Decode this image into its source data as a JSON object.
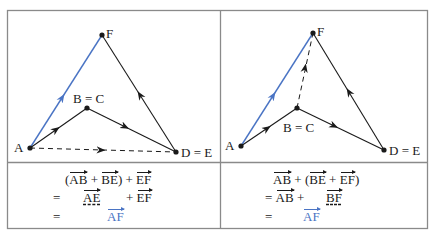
{
  "colors": {
    "border": "#8a8a8a",
    "line": "#1a1a1a",
    "accent_blue": "#4a74c4"
  },
  "left_panel": {
    "points": {
      "F": {
        "label": "F",
        "x": 102,
        "y": 35
      },
      "BC": {
        "label": "B = C",
        "x": 87,
        "y": 108
      },
      "A": {
        "label": "A",
        "x": 30,
        "y": 148
      },
      "DE": {
        "label": "D = E",
        "x": 176,
        "y": 152
      }
    },
    "equations": {
      "line1": {
        "open": "(",
        "v1": "AB",
        "plus1": " + ",
        "v2": "BE",
        "close": ")",
        "plus2": " + ",
        "v3": "EF"
      },
      "line2": {
        "eq": "=",
        "v1": "AE",
        "plus": "+ ",
        "v2": "EF"
      },
      "line3": {
        "eq": "=",
        "v1": "AF"
      }
    }
  },
  "right_panel": {
    "points": {
      "F": {
        "label": "F",
        "x": 313,
        "y": 33
      },
      "BC": {
        "label": "B = C",
        "x": 297,
        "y": 108
      },
      "A": {
        "label": "A",
        "x": 241,
        "y": 146
      },
      "DE": {
        "label": "D = E",
        "x": 384,
        "y": 150
      }
    },
    "equations": {
      "line1": {
        "v1": "AB",
        "plus1": " + (",
        "v2": "BE",
        "plus2": " + ",
        "v3": "EF",
        "close": ")"
      },
      "line2": {
        "eq": "= ",
        "v1": "AB",
        "plus": " +",
        "v2": "BF"
      },
      "line3": {
        "eq": "=",
        "v1": "AF"
      }
    }
  }
}
